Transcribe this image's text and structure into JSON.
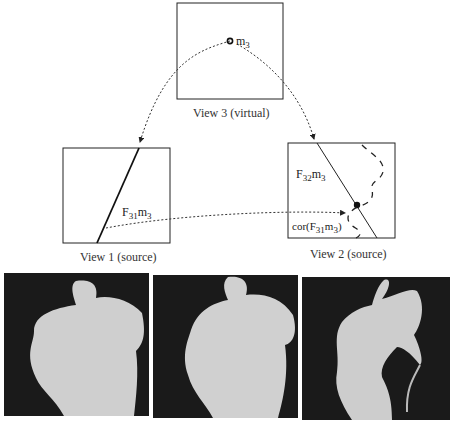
{
  "diagram": {
    "views": [
      {
        "id": "view3",
        "caption": "View 3 (virtual)",
        "point_label": "m",
        "point_sub": "3"
      },
      {
        "id": "view1",
        "caption": "View 1 (source)",
        "line_label": "F",
        "line_sub": "31",
        "line_label2": "m",
        "line_sub2": "3"
      },
      {
        "id": "view2",
        "caption": "View 2 (source)",
        "line_label": "F",
        "line_sub": "32",
        "line_label2": "m",
        "line_sub2": "3",
        "cor_label": "cor(F",
        "cor_sub": "31",
        "cor_mid": "m",
        "cor_sub2": "3",
        "cor_end": ")"
      }
    ]
  },
  "photos": [
    {
      "name": "source-view-1-torso"
    },
    {
      "name": "source-view-2-torso"
    },
    {
      "name": "virtual-view-3-torso"
    }
  ]
}
